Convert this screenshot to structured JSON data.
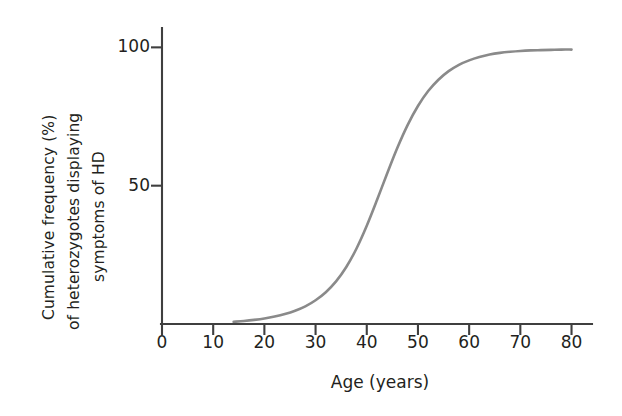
{
  "chart_data": {
    "type": "line",
    "title": "",
    "subtitle": "",
    "xlabel": "Age (years)",
    "ylabel": "Cumulative frequency (%) of heterozygotes displaying symptoms of HD",
    "ylabel_lines": [
      "Cumulative frequency (%)",
      "of heterozygotes displaying",
      "symptoms of HD"
    ],
    "xlim": [
      0,
      84
    ],
    "ylim": [
      0,
      107
    ],
    "xticks": [
      0,
      10,
      20,
      30,
      40,
      50,
      60,
      70,
      80
    ],
    "xtick_labels": [
      "0",
      "10",
      "20",
      "30",
      "40",
      "50",
      "60",
      "70",
      "80"
    ],
    "yticks": [
      50,
      100
    ],
    "ytick_labels": [
      "50",
      "100"
    ],
    "grid": false,
    "legend": false,
    "legend_position": "none",
    "series": [
      {
        "name": "Cumulative onset of HD symptoms",
        "color": "#8a8a8a",
        "x": [
          14,
          16,
          18,
          20,
          22,
          24,
          26,
          28,
          30,
          32,
          34,
          36,
          38,
          40,
          42,
          44,
          46,
          48,
          50,
          52,
          54,
          56,
          58,
          60,
          62,
          64,
          66,
          68,
          70,
          72,
          74,
          76,
          78,
          80
        ],
        "y": [
          0.8,
          1.1,
          1.5,
          2.0,
          2.7,
          3.6,
          4.8,
          6.4,
          8.6,
          11.5,
          15.4,
          20.6,
          27.3,
          35.5,
          44.8,
          54.5,
          63.8,
          72.0,
          78.8,
          84.2,
          88.3,
          91.4,
          93.7,
          95.3,
          96.5,
          97.4,
          98.0,
          98.4,
          98.7,
          98.9,
          99.0,
          99.1,
          99.2,
          99.2
        ]
      }
    ],
    "annotations": [],
    "axis_color": "#3f3f3f",
    "text_color": "#231f20",
    "background": "#ffffff"
  },
  "axes": {
    "x_axis_name": "age-axis",
    "y_axis_name": "cumulative-frequency-axis"
  }
}
